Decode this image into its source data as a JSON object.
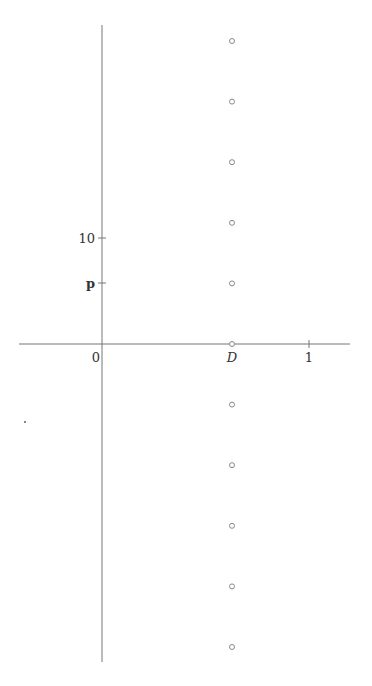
{
  "diagram": {
    "type": "number-line-plot",
    "colors": {
      "axis": "#777777",
      "marker": "#888888",
      "text": "#333333",
      "background": "#ffffff"
    },
    "x_axis": {
      "labels": [
        {
          "text": "0",
          "value": 0
        },
        {
          "text": "D",
          "value": "D",
          "italic": true
        },
        {
          "text": "1",
          "value": 1
        }
      ]
    },
    "y_axis": {
      "labels": [
        {
          "text": "10",
          "value": 10
        },
        {
          "text": "p",
          "value": "p",
          "bold": true
        }
      ]
    },
    "markers": {
      "shape": "hollow-circle",
      "column": "D",
      "count": 11,
      "rows": [
        5,
        4,
        3,
        2,
        1,
        0,
        -1,
        -2,
        -3,
        -4,
        -5
      ]
    },
    "stray_dot": true
  }
}
